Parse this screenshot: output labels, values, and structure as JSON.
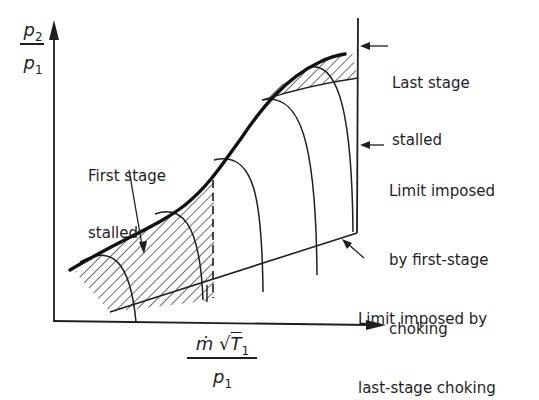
{
  "axes": {
    "y_label": {
      "numerator": "p",
      "numerator_sub": "2",
      "denominator": "p",
      "denominator_sub": "1"
    },
    "x_label": {
      "numerator_prefix": "ṁ",
      "sqrt_symbol": "√",
      "numerator_var": "T",
      "numerator_sub": "1",
      "denominator": "p",
      "denominator_sub": "1"
    }
  },
  "annotations": {
    "last_stage_stalled": {
      "line1": "Last stage",
      "line2": "stalled"
    },
    "first_stage_stalled": {
      "line1": "First stage",
      "line2": "stalled"
    },
    "first_stage_choking": {
      "line1": "Limit imposed",
      "line2": "by first-stage",
      "line3": "choking"
    },
    "last_stage_choking": {
      "line1": "Limit imposed by",
      "line2": "last-stage choking"
    }
  },
  "colors": {
    "ink": "#1e1e1e",
    "background": "#ffffff"
  }
}
